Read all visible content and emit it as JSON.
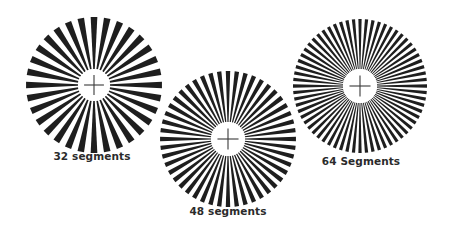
{
  "figure": {
    "background": "#ffffff",
    "spoke_color": "#1e1e1e",
    "crosshair_color": "#3a3a3a",
    "stars": [
      {
        "label": "32 segments",
        "segments": 32,
        "center_x": 94,
        "center_y": 85,
        "outer_radius": 68,
        "inner_radius": 16,
        "caption_x": 92,
        "caption_y": 157
      },
      {
        "label": "48 segments",
        "segments": 48,
        "center_x": 228,
        "center_y": 139,
        "outer_radius": 68,
        "inner_radius": 17,
        "caption_x": 228,
        "caption_y": 212
      },
      {
        "label": "64 Segments",
        "segments": 64,
        "center_x": 360,
        "center_y": 86,
        "outer_radius": 67,
        "inner_radius": 17,
        "caption_x": 361,
        "caption_y": 162
      }
    ]
  }
}
